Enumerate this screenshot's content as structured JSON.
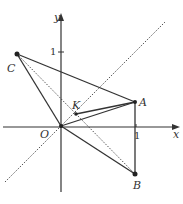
{
  "diagram": {
    "type": "coordinate-geometry",
    "colors": {
      "line": "#333333",
      "dotted": "#555555",
      "background": "#ffffff"
    },
    "axes": {
      "x_label": "x",
      "y_label": "y",
      "origin_label": "O",
      "x_tick_label": "1",
      "y_tick_label": "1"
    },
    "points": [
      {
        "name": "O",
        "label": "O",
        "px": [
          61,
          126
        ]
      },
      {
        "name": "A",
        "label": "A",
        "px": [
          135,
          102
        ]
      },
      {
        "name": "B",
        "label": "B",
        "px": [
          135,
          174
        ]
      },
      {
        "name": "C",
        "label": "C",
        "px": [
          17,
          54
        ]
      },
      {
        "name": "K",
        "label": "K",
        "px": [
          76,
          114
        ]
      }
    ],
    "segments_solid": [
      "C-A",
      "C-O",
      "O-A",
      "O-B",
      "K-A",
      "A-B"
    ],
    "segments_dotted": [
      "C-B",
      "line y=x"
    ]
  }
}
